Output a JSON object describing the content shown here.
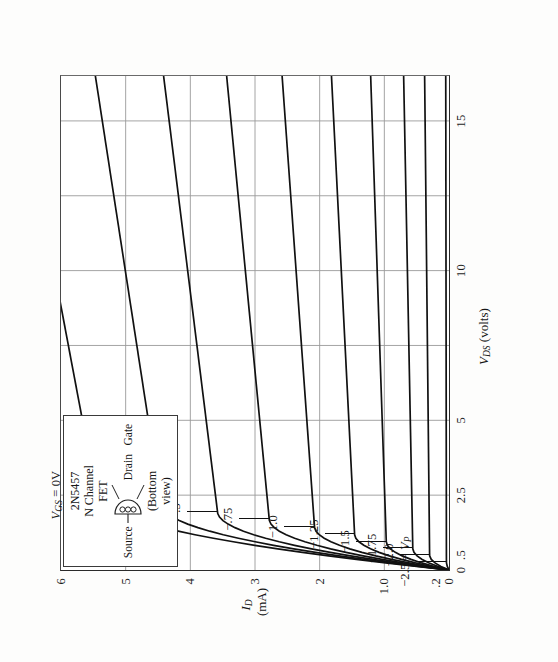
{
  "figure": {
    "device_label": {
      "line1": "2N5457",
      "line2": "N Channel",
      "line3": "FET",
      "pin_source": "Source",
      "pin_drain": "Drain",
      "pin_gate": "Gate",
      "view_note_line1": "(Bottom",
      "view_note_line2": "view)"
    },
    "ink_color": "#111111",
    "grid_color": "#9a9a9a",
    "axis_color": "#2a2a2a"
  },
  "chart_data": {
    "type": "line",
    "title": "",
    "xlabel": "V_DS (volts)",
    "ylabel": "I_D (mA)",
    "xlabel_parts": {
      "symbol": "V",
      "sub": "DS",
      "units": "(volts)"
    },
    "ylabel_parts": {
      "symbol": "I",
      "sub": "D",
      "units": "(mA)"
    },
    "xlim": [
      0,
      16.5
    ],
    "ylim": [
      0,
      6
    ],
    "grid": true,
    "legend_position": "inline-curve-labels",
    "xticks": [
      0,
      0.5,
      2.5,
      5,
      10,
      15
    ],
    "xticklabels": [
      "0",
      ".5",
      "2.5",
      "5",
      "10",
      "15"
    ],
    "yticks": [
      0,
      0.2,
      1.0,
      2,
      3,
      4,
      5,
      6
    ],
    "yticklabels": [
      "0",
      ".2",
      "1.0",
      "2",
      "3",
      "4",
      "5",
      "6"
    ],
    "xgridlines": [
      2.5,
      5,
      7.5,
      10,
      12.5,
      15
    ],
    "ygridlines": [
      1.0,
      2,
      3,
      4,
      5
    ],
    "series": [
      {
        "name": "VGS = 0V",
        "vgs": 0.0,
        "label": "V_GS = 0V",
        "idss": 5.45,
        "knee_v": 2.5,
        "label_x": 2.5,
        "label_y": 5.45
      },
      {
        "name": "-.25",
        "vgs": -0.25,
        "label": "−.25",
        "idss": 4.45,
        "knee_v": 2.2,
        "label_x": 2.2,
        "label_y": 4.45
      },
      {
        "name": "-.5",
        "vgs": -0.5,
        "label": "−.5",
        "idss": 3.58,
        "knee_v": 1.95,
        "label_x": 1.95,
        "label_y": 3.58
      },
      {
        "name": "-.75",
        "vgs": -0.75,
        "label": "−.75",
        "idss": 2.78,
        "knee_v": 1.7,
        "label_x": 1.7,
        "label_y": 2.78
      },
      {
        "name": "-1.0",
        "vgs": -1.0,
        "label": "−1.0",
        "idss": 2.08,
        "knee_v": 1.45,
        "label_x": 1.45,
        "label_y": 2.08
      },
      {
        "name": "-1.25",
        "vgs": -1.25,
        "label": "−1.25",
        "idss": 1.46,
        "knee_v": 1.2,
        "label_x": 1.2,
        "label_y": 1.46
      },
      {
        "name": "-1.5",
        "vgs": -1.5,
        "label": "−1.5",
        "idss": 0.97,
        "knee_v": 0.95,
        "label_x": 0.95,
        "label_y": 0.97
      },
      {
        "name": "-1.75",
        "vgs": -1.75,
        "label": "−1.75",
        "idss": 0.56,
        "knee_v": 0.72,
        "label_x": 0.72,
        "label_y": 0.56
      },
      {
        "name": "-2.0",
        "vgs": -2.0,
        "label": "−2.0",
        "idss": 0.3,
        "knee_v": 0.5,
        "label_x": 0.5,
        "label_y": 0.3
      },
      {
        "name": "-2.5 = Vp",
        "vgs": -2.5,
        "label": "−2.5 = V_P",
        "idss": 0.04,
        "knee_v": 0.28,
        "label_x": 0.28,
        "label_y": 0.04
      }
    ],
    "annotations": [
      "V_GS = 0V",
      "−.25",
      "−.5",
      "−.75",
      "−1.0",
      "−1.25",
      "−1.5",
      "−1.75",
      "−2.0",
      "−2.5 = V_P"
    ]
  }
}
